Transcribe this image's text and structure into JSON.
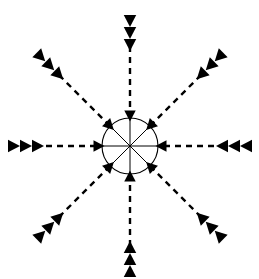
{
  "figure": {
    "type": "vector-diagram",
    "width": 259,
    "height": 279,
    "background_color": "#ffffff",
    "stroke_color": "#000000",
    "marker_fill_color": "#000000"
  },
  "center": {
    "label": "central circle hub",
    "cx": 130,
    "cy": 146,
    "radius": 28,
    "stroke_width": 1.1,
    "fill": "none",
    "spoke_count": 8,
    "spoke_stroke_width": 1.0
  },
  "style": {
    "dash_pattern": "6 5",
    "dash_stroke_width": 2.4,
    "arrowhead_size": 11,
    "trail_marker_size": 12,
    "trail_marker_count_per_arm": 3
  },
  "arms": [
    {
      "name": "north",
      "label": "arrow-from-north",
      "angle_deg": 270,
      "direction": "downward",
      "dash_start": [
        130,
        46
      ],
      "dash_end": [
        130,
        113
      ],
      "arrowhead_at": [
        130,
        116
      ],
      "trail_markers": [
        [
          130,
          21
        ],
        [
          130,
          33
        ],
        [
          130,
          45
        ]
      ]
    },
    {
      "name": "northeast",
      "label": "arrow-from-northeast",
      "angle_deg": 315,
      "direction": "down-left",
      "dash_start": [
        201,
        75
      ],
      "dash_end": [
        152,
        124
      ],
      "arrowhead_at": [
        150,
        126
      ],
      "trail_markers": [
        [
          219,
          57
        ],
        [
          210,
          66
        ],
        [
          201,
          75
        ]
      ]
    },
    {
      "name": "east",
      "label": "arrow-from-east",
      "angle_deg": 0,
      "direction": "leftward",
      "dash_start": [
        214,
        146
      ],
      "dash_end": [
        164,
        146
      ],
      "arrowhead_at": [
        161,
        146
      ],
      "trail_markers": [
        [
          246,
          146
        ],
        [
          234,
          146
        ],
        [
          222,
          146
        ]
      ]
    },
    {
      "name": "southeast",
      "label": "arrow-from-southeast",
      "angle_deg": 45,
      "direction": "up-left",
      "dash_start": [
        201,
        217
      ],
      "dash_end": [
        152,
        168
      ],
      "arrowhead_at": [
        150,
        166
      ],
      "trail_markers": [
        [
          219,
          235
        ],
        [
          210,
          226
        ],
        [
          201,
          217
        ]
      ]
    },
    {
      "name": "south",
      "label": "arrow-from-south",
      "angle_deg": 90,
      "direction": "upward",
      "dash_start": [
        130,
        246
      ],
      "dash_end": [
        130,
        179
      ],
      "arrowhead_at": [
        130,
        176
      ],
      "trail_markers": [
        [
          130,
          271
        ],
        [
          130,
          259
        ],
        [
          130,
          247
        ]
      ]
    },
    {
      "name": "southwest",
      "label": "arrow-from-southwest",
      "angle_deg": 135,
      "direction": "up-right",
      "dash_start": [
        59,
        217
      ],
      "dash_end": [
        108,
        168
      ],
      "arrowhead_at": [
        110,
        166
      ],
      "trail_markers": [
        [
          41,
          235
        ],
        [
          50,
          226
        ],
        [
          59,
          217
        ]
      ]
    },
    {
      "name": "west",
      "label": "arrow-from-west",
      "angle_deg": 180,
      "direction": "rightward",
      "dash_start": [
        46,
        146
      ],
      "dash_end": [
        96,
        146
      ],
      "arrowhead_at": [
        99,
        146
      ],
      "trail_markers": [
        [
          14,
          146
        ],
        [
          26,
          146
        ],
        [
          38,
          146
        ]
      ]
    },
    {
      "name": "northwest",
      "label": "arrow-from-northwest",
      "angle_deg": 225,
      "direction": "down-right",
      "dash_start": [
        59,
        75
      ],
      "dash_end": [
        108,
        124
      ],
      "arrowhead_at": [
        110,
        126
      ],
      "trail_markers": [
        [
          41,
          57
        ],
        [
          50,
          66
        ],
        [
          59,
          75
        ]
      ]
    }
  ]
}
